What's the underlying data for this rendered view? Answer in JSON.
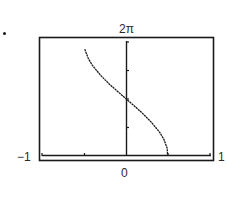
{
  "marker": "bullet",
  "labels": {
    "y_max": "2π",
    "x_min": "−1",
    "x_max": "1",
    "x_zero": "0"
  },
  "colors": {
    "ink": "#1a1a1a",
    "background": "#ffffff"
  },
  "chart_data": {
    "type": "line",
    "title": "",
    "xlabel": "",
    "ylabel": "",
    "xlim": [
      -1,
      1
    ],
    "ylim": [
      0,
      6.2832
    ],
    "tick_labels": {
      "x": [
        "−1",
        "0",
        "1"
      ],
      "y_top": "2π"
    },
    "x_ticks": [
      -1,
      -0.5,
      0,
      0.5,
      1
    ],
    "y_ticks": [
      0,
      1.5708,
      3.1416,
      4.7124,
      6.2832
    ],
    "grid": false,
    "legend": null,
    "series": [
      {
        "name": "curve",
        "x": [
          -0.49,
          -0.45,
          -0.4,
          -0.3,
          -0.2,
          -0.1,
          0,
          0.1,
          0.2,
          0.3,
          0.4,
          0.45,
          0.49
        ],
        "y": [
          5.88,
          5.38,
          4.99,
          4.43,
          3.96,
          3.55,
          3.14,
          2.74,
          2.32,
          1.85,
          1.29,
          0.9,
          0.4
        ]
      }
    ]
  }
}
